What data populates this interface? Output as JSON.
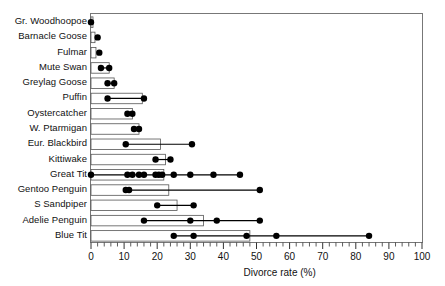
{
  "chart_data": {
    "type": "bar",
    "title": "",
    "subtitle": "",
    "xlabel": "Divorce rate (%)",
    "ylabel": "",
    "xlim": [
      0,
      100
    ],
    "xticks": [
      0,
      10,
      20,
      30,
      40,
      50,
      60,
      70,
      80,
      90,
      100
    ],
    "xtick_labels": [
      "0",
      "10",
      "20",
      "30",
      "40",
      "50",
      "60",
      "70",
      "80",
      "90",
      "100"
    ],
    "minor_ticks_interval": 2,
    "grid": false,
    "legend": null,
    "orientation": "horizontal",
    "categories": [
      "Gr. Woodhoopoe",
      "Barnacle Goose",
      "Fulmar",
      "Mute Swan",
      "Greylag Goose",
      "Puffin",
      "Oystercatcher",
      "W. Ptarmigan",
      "Eur. Blackbird",
      "Kittiwake",
      "Great Tit",
      "Gentoo Penguin",
      "S Sandpiper",
      "Adelie Penguin",
      "Blue Tit"
    ],
    "series": [
      {
        "name": "range box (bar)",
        "description": "Horizontal open box spanning from 0 to the species' upper range value",
        "values": [
          0.6,
          1.2,
          1.5,
          5.5,
          7.0,
          15.5,
          12.5,
          14.5,
          21.0,
          22.5,
          22.0,
          23.5,
          26.0,
          34.0,
          48.0
        ]
      },
      {
        "name": "study estimates (filled circles)",
        "description": "Individual published divorce-rate estimates per species",
        "points": [
          [
            0.0
          ],
          [
            2.0
          ],
          [
            2.5
          ],
          [
            3.0,
            5.5
          ],
          [
            5.0,
            7.0
          ],
          [
            5.0,
            16.0
          ],
          [
            11.0,
            12.5
          ],
          [
            13.0,
            14.5
          ],
          [
            10.5,
            30.5
          ],
          [
            19.5,
            24.0
          ],
          [
            0.0,
            11.0,
            12.5,
            14.5,
            16.0,
            19.5,
            20.5,
            21.5,
            25.0,
            30.0,
            37.0,
            45.0
          ],
          [
            10.5,
            11.5,
            51.0
          ],
          [
            20.0,
            31.0
          ],
          [
            16.0,
            30.0,
            38.0,
            51.0
          ],
          [
            25.0,
            31.0,
            47.0,
            56.0,
            84.0
          ]
        ]
      }
    ],
    "marker": {
      "shape": "circle",
      "color": "#000000",
      "size": 5.6
    },
    "box": {
      "fill": "#ffffff",
      "edge": "#555555"
    },
    "connector_line": {
      "color": "#000000",
      "width": 1.2
    }
  },
  "axis": {
    "xlabel": "Divorce rate (%)"
  }
}
